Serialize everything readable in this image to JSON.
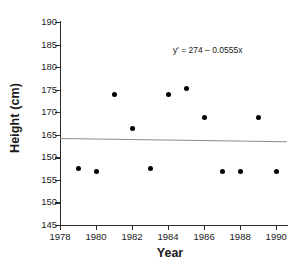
{
  "chart_data": {
    "type": "scatter",
    "title": "",
    "xlabel": "Year",
    "ylabel": "Height (cm)",
    "x": [
      1979,
      1980,
      1981,
      1982,
      1983,
      1984,
      1985,
      1986,
      1987,
      1988,
      1989,
      1990
    ],
    "values": [
      157.5,
      156.8,
      174.0,
      166.5,
      157.5,
      174.0,
      175.2,
      168.8,
      156.8,
      156.8,
      168.8,
      156.8
    ],
    "series": [
      {
        "name": "Height",
        "points": [
          {
            "x": 1979,
            "y": 157.5
          },
          {
            "x": 1980,
            "y": 156.8
          },
          {
            "x": 1981,
            "y": 174.0
          },
          {
            "x": 1982,
            "y": 166.5
          },
          {
            "x": 1983,
            "y": 157.5
          },
          {
            "x": 1984,
            "y": 174.0
          },
          {
            "x": 1985,
            "y": 175.2
          },
          {
            "x": 1986,
            "y": 168.8
          },
          {
            "x": 1987,
            "y": 156.8
          },
          {
            "x": 1988,
            "y": 156.8
          },
          {
            "x": 1989,
            "y": 168.8
          },
          {
            "x": 1990,
            "y": 156.8
          }
        ],
        "marker_color": "#000000"
      }
    ],
    "xlim": [
      1978,
      1990.6
    ],
    "ylim": [
      145,
      190
    ],
    "xticks": [
      1978,
      1980,
      1982,
      1984,
      1986,
      1988,
      1990
    ],
    "xtick_labels": [
      "1978",
      "1980",
      "1982",
      "1984",
      "1986",
      "1988",
      "1990"
    ],
    "yticks": [
      190,
      185,
      180,
      175,
      170,
      165,
      160,
      155,
      150,
      145
    ],
    "ytick_labels": [
      "190",
      "185",
      "180",
      "175",
      "170",
      "165",
      "150",
      "155",
      "150",
      "145"
    ],
    "grid": false,
    "legend": null,
    "trendline": {
      "equation": "y' = 274 – 0.0555x",
      "intercept": 274,
      "slope": -0.0555,
      "color": "#8c8c8c",
      "x_start": 1978,
      "x_end": 1990.6,
      "y_start": 164.2,
      "y_end": 163.5
    },
    "annotations": [
      {
        "text": "y' = 274 – 0.0555x",
        "x": 1986.2,
        "y": 183.8
      }
    ]
  },
  "figure": {
    "background": "#ffffff",
    "axis_color": "#2b2b2b",
    "text_color": "#1a1a1a"
  }
}
